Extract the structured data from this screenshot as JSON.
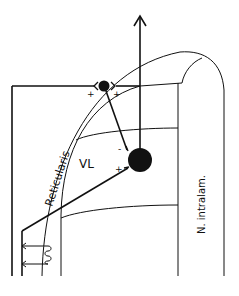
{
  "diagram": {
    "type": "neuroanatomy-circuit",
    "labels": {
      "reticularis": "Reticularis",
      "vl": "VL",
      "intralaminar": "N. intralam."
    },
    "signs": {
      "small_neuron_left_plus": "+",
      "small_neuron_right_plus": "+",
      "large_neuron_minus": "-",
      "large_neuron_plus": "+"
    },
    "colors": {
      "stroke": "#111111",
      "background": "#ffffff"
    }
  }
}
